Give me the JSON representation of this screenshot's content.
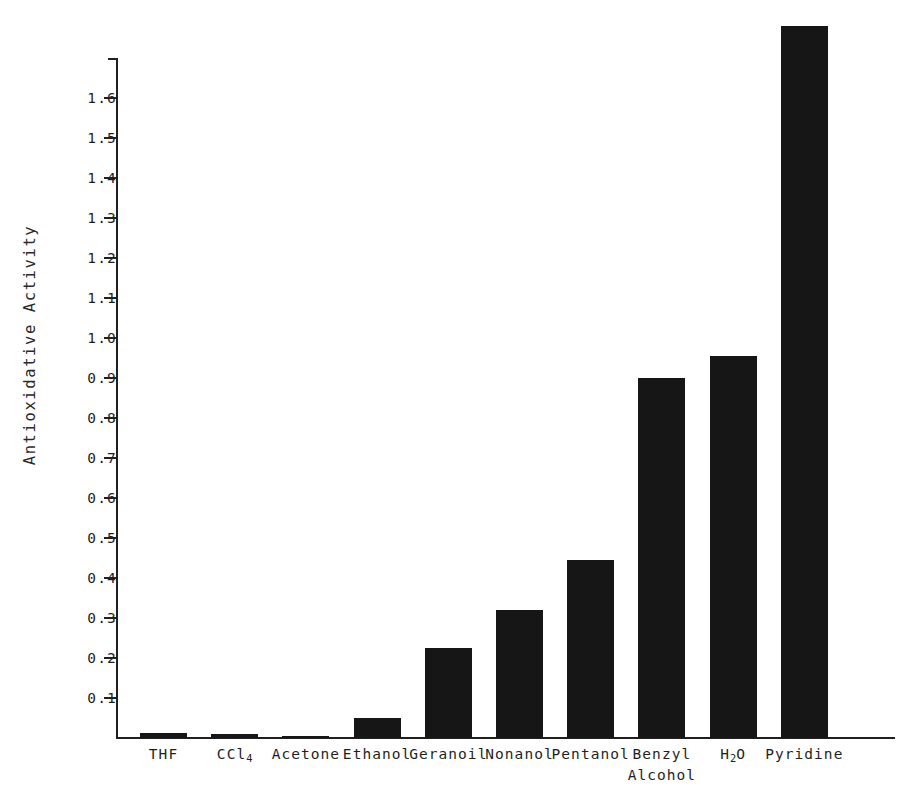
{
  "chart_data": {
    "type": "bar",
    "title": "",
    "xlabel": "",
    "ylabel": "Antioxidative Activity",
    "categories": [
      "THF",
      "CCl4",
      "Acetone",
      "Ethanol",
      "Geranoil",
      "Nonanol",
      "Pentanol",
      "Benzyl Alcohol",
      "H2O",
      "Pyridine"
    ],
    "category_labels_display": [
      {
        "line1": "THF",
        "line2": "",
        "sub": ""
      },
      {
        "line1": "CCl",
        "line2": "",
        "sub": "4"
      },
      {
        "line1": "Acetone",
        "line2": "",
        "sub": ""
      },
      {
        "line1": "Ethanol",
        "line2": "",
        "sub": ""
      },
      {
        "line1": "Geranoil",
        "line2": "",
        "sub": ""
      },
      {
        "line1": "Nonanol",
        "line2": "",
        "sub": ""
      },
      {
        "line1": "Pentanol",
        "line2": "",
        "sub": ""
      },
      {
        "line1": "Benzyl",
        "line2": "Alcohol",
        "sub": ""
      },
      {
        "line1": "H",
        "line2": "",
        "sub": "2",
        "after": "O"
      },
      {
        "line1": "Pyridine",
        "line2": "",
        "sub": ""
      }
    ],
    "values": [
      0.012,
      0.01,
      0.005,
      0.05,
      0.225,
      0.32,
      0.445,
      0.9,
      0.955,
      1.78
    ],
    "ylim": [
      0,
      1.7
    ],
    "yticks": [
      0.1,
      0.2,
      0.3,
      0.4,
      0.5,
      0.6,
      0.7,
      0.8,
      0.9,
      1.0,
      1.1,
      1.2,
      1.3,
      1.4,
      1.5,
      1.6
    ],
    "ytick_labels": [
      "0.1",
      "0.2",
      "0.3",
      "0.4",
      "0.5",
      "0.6",
      "0.7",
      "0.8",
      "0.9",
      "1.0",
      "1.1",
      "1.2",
      "1.3",
      "1.4",
      "1.5",
      "1.6"
    ],
    "grid": false,
    "legend": null,
    "bar_color": "#161616",
    "axis_color": "#202020",
    "background_color": "#ffffff"
  }
}
